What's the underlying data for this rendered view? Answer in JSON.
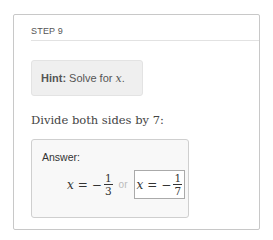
{
  "step": {
    "label": "STEP 9"
  },
  "hint": {
    "bold": "Hint:",
    "text": "Solve for",
    "variable": "x",
    "suffix": "."
  },
  "instruction": "Divide both sides by 7:",
  "answer": {
    "label": "Answer:",
    "solutions": [
      {
        "variable": "x",
        "equals": "=",
        "sign": "−",
        "numerator": "1",
        "denominator": "3",
        "highlighted": false
      },
      {
        "variable": "x",
        "equals": "=",
        "sign": "−",
        "numerator": "1",
        "denominator": "7",
        "highlighted": true
      }
    ],
    "separator": "or"
  }
}
